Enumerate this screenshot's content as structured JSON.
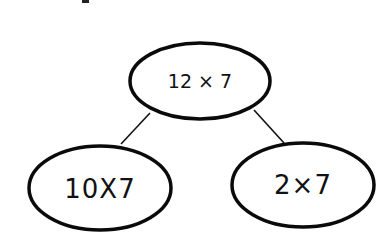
{
  "diagram": {
    "type": "number-bond",
    "root": {
      "label": "12 × 7"
    },
    "children": [
      {
        "label": "10X7"
      },
      {
        "label": "2×7"
      }
    ],
    "colors": {
      "stroke": "#0a0a0a",
      "background": "#ffffff"
    }
  }
}
